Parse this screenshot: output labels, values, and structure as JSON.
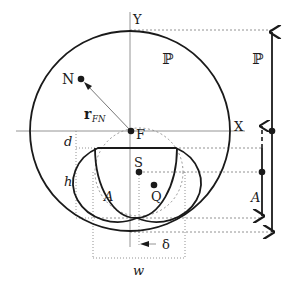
{
  "diagram": {
    "labels": {
      "y_axis": "Y",
      "x_axis": "X",
      "point_n": "N",
      "point_f": "F",
      "point_s": "S",
      "point_q": "Q",
      "vector_r": "r",
      "vector_r_sub": "FN",
      "region_p": "ℙ",
      "side_p": "ℙ",
      "region_a": "A",
      "side_a": "A",
      "dim_d": "d",
      "dim_h": "h",
      "dim_w": "w",
      "dim_delta": "δ"
    },
    "colors": {
      "stroke": "#1a1a1a",
      "axis": "#888888",
      "dashed": "#777777"
    }
  }
}
